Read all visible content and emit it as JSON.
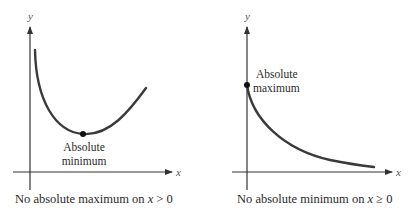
{
  "colors": {
    "axis": "#333333",
    "curve": "#3a3a3a",
    "point": "#111111",
    "text": "#2a2a2a",
    "background": "#ffffff"
  },
  "panels": [
    {
      "id": "left",
      "axes": {
        "x_label": "x",
        "y_label": "y"
      },
      "annotation": {
        "line1": "Absolute",
        "line2": "minimum"
      },
      "caption": {
        "prefix": "No absolute maximum on ",
        "var": "x",
        "relation": " > 0"
      },
      "curve": "U-shaped, defined for x > 0; decreases steeply near y-axis, minimum, then increases",
      "marked_point": "absolute minimum (vertex of curve)"
    },
    {
      "id": "right",
      "axes": {
        "x_label": "x",
        "y_label": "y"
      },
      "annotation": {
        "line1": "Absolute",
        "line2": "maximum"
      },
      "caption": {
        "prefix": "No absolute minimum on ",
        "var": "x",
        "relation": " ≥ 0"
      },
      "curve": "Decreasing, concave-up curve starting on the y-axis at x = 0 and approaching the x-axis",
      "marked_point": "absolute maximum at x = 0 on y-axis"
    }
  ]
}
